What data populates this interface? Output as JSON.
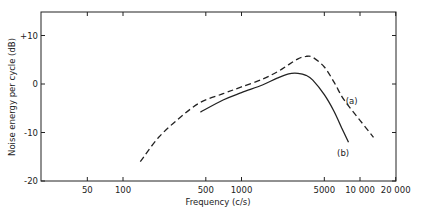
{
  "chart_data": {
    "type": "line",
    "title": "",
    "xlabel": "Frequency (c/s)",
    "ylabel": "Noise energy per cycle (dB)",
    "xscale": "log",
    "xlim": [
      20,
      20000
    ],
    "ylim": [
      -20,
      15
    ],
    "grid": false,
    "x_ticks": [
      50,
      100,
      500,
      1000,
      5000,
      10000,
      20000
    ],
    "x_tick_labels": [
      "50",
      "100",
      "500",
      "1000",
      "5000",
      "10 000",
      "20 000"
    ],
    "y_ticks": [
      10,
      0,
      -10,
      -20
    ],
    "y_tick_labels": [
      "+10",
      "0",
      "-10",
      "-20"
    ],
    "series": [
      {
        "name": "(a)",
        "style": "dashed",
        "x": [
          140,
          200,
          300,
          450,
          700,
          1000,
          1500,
          2000,
          2500,
          3000,
          3500,
          4000,
          5000,
          6000,
          7000,
          8000,
          10000,
          13000
        ],
        "y": [
          -16,
          -11,
          -7,
          -3.8,
          -2,
          -0.6,
          1,
          2.5,
          4,
          5.2,
          5.7,
          5.5,
          3.5,
          0.5,
          -2.5,
          -4.5,
          -7.5,
          -11
        ]
      },
      {
        "name": "(b)",
        "style": "solid",
        "x": [
          450,
          700,
          1000,
          1500,
          2000,
          2500,
          3000,
          3500,
          4000,
          5000,
          6000,
          7000,
          8000
        ],
        "y": [
          -5.8,
          -3.3,
          -1.8,
          -0.2,
          1.2,
          2.1,
          2.2,
          1.8,
          0.8,
          -2.2,
          -5.5,
          -9,
          -12
        ]
      }
    ],
    "annotations": [
      {
        "text": "(a)",
        "x": 8500,
        "y": -3.5
      },
      {
        "text": "(b)",
        "x": 7200,
        "y": -14.2
      }
    ]
  }
}
